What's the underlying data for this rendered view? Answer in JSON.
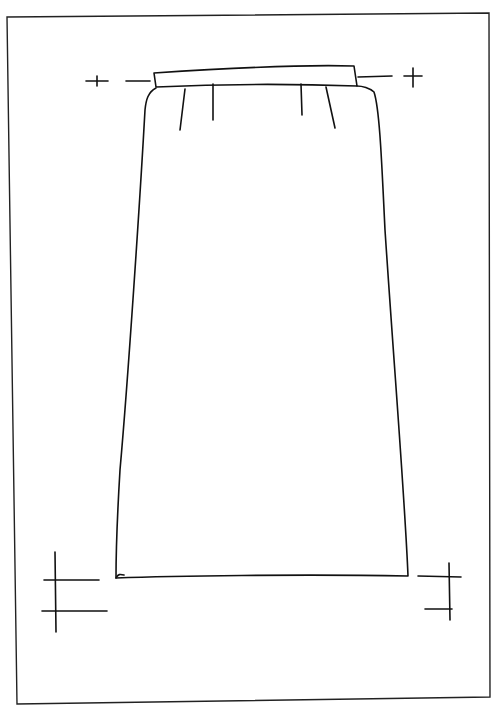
{
  "drawing": {
    "subject": "skirt-technical-flat",
    "stroke_color": "#111111",
    "background": "#ffffff",
    "elements": [
      "frame",
      "waistband",
      "skirt-body",
      "darts",
      "waist-markers",
      "hem-markers"
    ],
    "dart_count": 4
  }
}
